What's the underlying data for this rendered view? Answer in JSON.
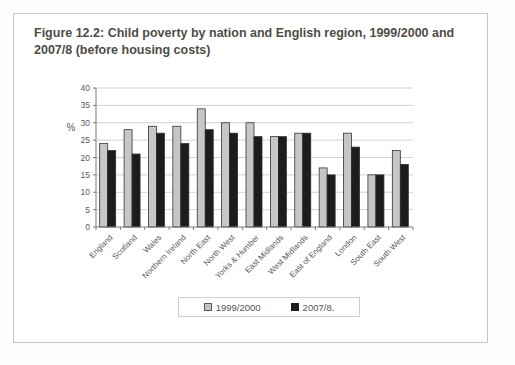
{
  "figure": {
    "title_line1": "Figure 12.2: Child poverty by nation and English region, 1999/2000 and",
    "title_line2": "2007/8 (before housing costs)"
  },
  "chart_data": {
    "type": "bar",
    "title": "Figure 12.2: Child poverty by nation and English region, 1999/2000 and 2007/8 (before housing costs)",
    "xlabel": "",
    "ylabel": "%",
    "ylim": [
      0,
      40
    ],
    "yticks": [
      0,
      5,
      10,
      15,
      20,
      25,
      30,
      35,
      40
    ],
    "grid": true,
    "legend_position": "bottom-center",
    "categories": [
      "England",
      "Scotland",
      "Wales",
      "Northern Ireland",
      "North East",
      "North West",
      "Yorks & Humber",
      "East Midlands",
      "West Midlands",
      "East of England",
      "London",
      "South East",
      "South West"
    ],
    "series": [
      {
        "name": "1999/2000",
        "color": "#c6c6c6",
        "values": [
          24,
          28,
          29,
          29,
          34,
          30,
          30,
          26,
          27,
          17,
          27,
          15,
          22
        ]
      },
      {
        "name": "2007/8.",
        "color": "#1c1c1c",
        "values": [
          22,
          21,
          27,
          24,
          28,
          27,
          26,
          26,
          27,
          15,
          23,
          15,
          18
        ]
      }
    ]
  },
  "colors": {
    "figure_border": "#c6c6c6",
    "title_text": "#4f4c47",
    "axis_line": "#7a7a7a",
    "gridline": "#d2d2d2",
    "tick_text": "#595959",
    "bar_outline": "#2a2a2a",
    "legend_border": "#cfcfcf",
    "legend_text": "#555555"
  }
}
